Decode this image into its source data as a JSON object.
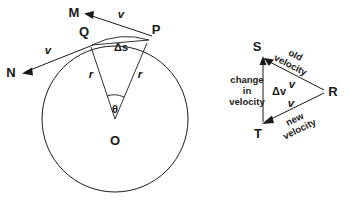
{
  "figure": {
    "background_color": "#ffffff",
    "ink_color": "#1a1a1a"
  },
  "circle_diagram": {
    "name": "circle-diagram",
    "center_label": "O",
    "point_p": "P",
    "point_q": "Q",
    "point_m": "M",
    "point_n": "N",
    "radius_label_left": "r",
    "radius_label_right": "r",
    "angle_label": "θ",
    "arc_label": "Δs",
    "velocity_at_p": "v",
    "velocity_at_q": "v",
    "geometry": {
      "center_x": 115,
      "center_y": 119,
      "radius": 73,
      "p_x": 150,
      "p_y": 36,
      "q_x": 88,
      "q_y": 40,
      "m_x": 80,
      "m_y": 13,
      "n_x": 16,
      "n_y": 73
    }
  },
  "vector_triangle": {
    "name": "velocity-triangle-diagram",
    "vertex_s": "S",
    "vertex_t": "T",
    "vertex_r": "R",
    "delta_v_label": "Δv",
    "old_velocity_line1": "old",
    "old_velocity_line2": "velocity",
    "new_velocity_line1": "new",
    "new_velocity_line2": "velocity",
    "change_line1": "change",
    "change_line2": "in",
    "change_line3": "velocity",
    "v_upper": "v",
    "v_lower": "v",
    "geometry": {
      "s_x": 263,
      "s_y": 57,
      "t_x": 263,
      "t_y": 123,
      "r_x": 325,
      "r_y": 92
    }
  }
}
